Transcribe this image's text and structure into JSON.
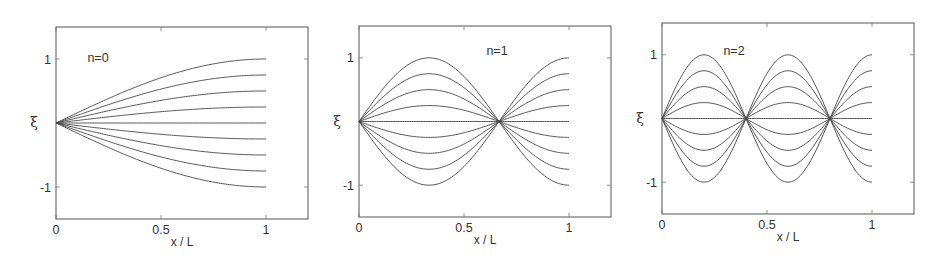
{
  "chart_data": [
    {
      "type": "line",
      "title": "",
      "annotation": "n=0",
      "xlabel": "x / L",
      "ylabel": "ξ",
      "xlim": [
        0,
        1.2
      ],
      "ylim": [
        -1.5,
        1.5
      ],
      "xticks": [
        0,
        0.5,
        1
      ],
      "xtick_labels": [
        "0",
        "0.5",
        "1"
      ],
      "yticks": [
        1,
        -1
      ],
      "ytick_labels": [
        "1",
        "-1"
      ],
      "grid": false,
      "function": "xi = A * sin((2n+1) * pi * x / 2)",
      "mode_n": 0,
      "amplitudes": [
        1,
        0.75,
        0.5,
        0.25,
        0,
        -0.25,
        -0.5,
        -0.75,
        -1
      ],
      "x_range": [
        0,
        1
      ],
      "nodes_x": [
        0
      ],
      "extrema_x": [
        1
      ]
    },
    {
      "type": "line",
      "title": "",
      "annotation": "n=1",
      "xlabel": "x / L",
      "ylabel": "ξ",
      "xlim": [
        0,
        1.2
      ],
      "ylim": [
        -1.5,
        1.5
      ],
      "xticks": [
        0,
        0.5,
        1
      ],
      "xtick_labels": [
        "0",
        "0.5",
        "1"
      ],
      "yticks": [
        1,
        -1
      ],
      "ytick_labels": [
        "1",
        "-1"
      ],
      "grid": false,
      "function": "xi = A * sin((2n+1) * pi * x / 2)",
      "mode_n": 1,
      "amplitudes": [
        1,
        0.75,
        0.5,
        0.25,
        0,
        -0.25,
        -0.5,
        -0.75,
        -1
      ],
      "x_range": [
        0,
        1
      ],
      "nodes_x": [
        0,
        0.667
      ],
      "extrema_x": [
        0.333,
        1
      ]
    },
    {
      "type": "line",
      "title": "",
      "annotation": "n=2",
      "xlabel": "x / L",
      "ylabel": "ξ",
      "xlim": [
        0,
        1.2
      ],
      "ylim": [
        -1.5,
        1.5
      ],
      "xticks": [
        0,
        0.5,
        1
      ],
      "xtick_labels": [
        "0",
        "0.5",
        "1"
      ],
      "yticks": [
        1,
        -1
      ],
      "ytick_labels": [
        "1",
        "-1"
      ],
      "grid": false,
      "function": "xi = A * sin((2n+1) * pi * x / 2)",
      "mode_n": 2,
      "amplitudes": [
        1,
        0.75,
        0.5,
        0.25,
        0,
        -0.25,
        -0.5,
        -0.75,
        -1
      ],
      "x_range": [
        0,
        1
      ],
      "nodes_x": [
        0,
        0.4,
        0.8
      ],
      "extrema_x": [
        0.2,
        0.6,
        1
      ]
    }
  ],
  "layout": {
    "panels": [
      {
        "left": 56,
        "top": 27,
        "right": 308,
        "bottom": 219,
        "ylabel_x": 34,
        "annot_x": 98,
        "annot_y": 62
      },
      {
        "left": 359,
        "top": 26,
        "right": 611,
        "bottom": 217,
        "ylabel_x": 337,
        "annot_x": 497,
        "annot_y": 55
      },
      {
        "left": 662,
        "top": 23,
        "right": 914,
        "bottom": 214,
        "ylabel_x": 640,
        "annot_x": 734,
        "annot_y": 55
      }
    ],
    "colors": {
      "frame": "#555555",
      "curve": "#444444",
      "text": "#333333"
    }
  }
}
